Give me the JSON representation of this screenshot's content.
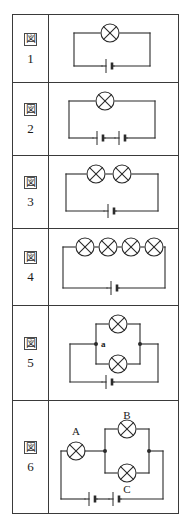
{
  "figure_table": {
    "kanji_label": "図",
    "symbols": {
      "lamp": "lamp-circle-x-icon",
      "battery_cell": "battery-cell-icon",
      "junction": "junction-dot-icon"
    },
    "rows": [
      {
        "number": "1",
        "name": "figure-1",
        "description": "single lamp with one battery cell in a simple loop",
        "lamp_count": 1,
        "cell_count": 1,
        "topology": "series",
        "labels": []
      },
      {
        "number": "2",
        "name": "figure-2",
        "description": "single lamp with two battery cells in series",
        "lamp_count": 1,
        "cell_count": 2,
        "topology": "series",
        "labels": []
      },
      {
        "number": "3",
        "name": "figure-3",
        "description": "two lamps in series with one battery cell",
        "lamp_count": 2,
        "cell_count": 1,
        "topology": "series",
        "labels": []
      },
      {
        "number": "4",
        "name": "figure-4",
        "description": "four lamps in series with one battery cell",
        "lamp_count": 4,
        "cell_count": 1,
        "topology": "series",
        "labels": []
      },
      {
        "number": "5",
        "name": "figure-5",
        "description": "two lamps in parallel with one battery cell, junction a marked",
        "lamp_count": 2,
        "cell_count": 1,
        "topology": "parallel",
        "labels": [
          "a"
        ]
      },
      {
        "number": "6",
        "name": "figure-6",
        "description": "lamp A in series with parallel lamps B and C, two battery cells",
        "lamp_count": 3,
        "cell_count": 2,
        "topology": "series-parallel",
        "labels": [
          "A",
          "B",
          "C"
        ]
      }
    ]
  }
}
